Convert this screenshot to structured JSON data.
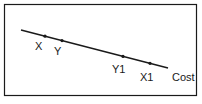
{
  "diagram": {
    "type": "line-with-points",
    "frame": {
      "x": 4,
      "y": 4,
      "width": 193,
      "height": 92,
      "stroke": "#1a1a1a"
    },
    "line": {
      "x1": 21,
      "y1": 30,
      "x2": 168,
      "y2": 68,
      "stroke": "#1a1a1a",
      "label": "Cost"
    },
    "points": [
      {
        "label": "X",
        "x": 45,
        "y": 36
      },
      {
        "label": "Y",
        "x": 62,
        "y": 40
      },
      {
        "label": "Y1",
        "x": 123,
        "y": 56
      },
      {
        "label": "X1",
        "x": 150,
        "y": 63
      }
    ]
  }
}
